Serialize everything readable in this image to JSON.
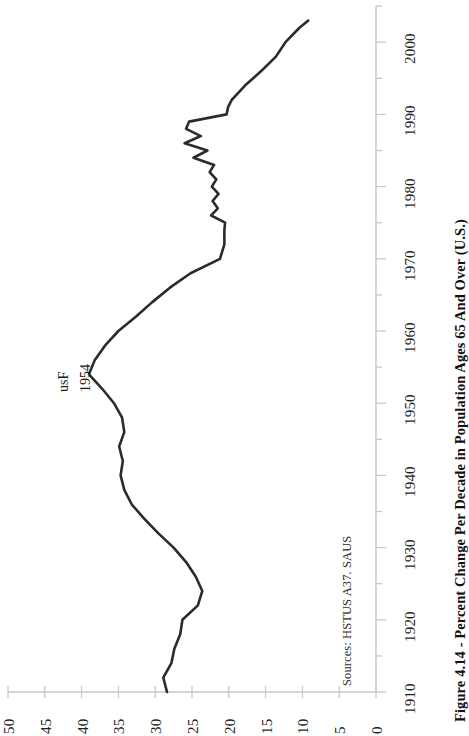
{
  "figure": {
    "title": "Figure 4.14 - Percent Change Per Decade in Population Ages 65 And Over (U.S.)",
    "source_note": "Sources: HSTUS A37. SAUS",
    "annotation_line1": "usF",
    "annotation_line2": "1954",
    "line_color": "#2b2b2b",
    "axis_color": "#c8c8c8",
    "text_color": "#1a1a1a",
    "background": "#ffffff",
    "orientation": "rotated-90-ccw"
  },
  "chart_data": {
    "type": "line",
    "title": "Figure 4.14 - Percent Change Per Decade in Population Ages 65 And Over (U.S.)",
    "subtitle": "",
    "xlabel": "",
    "ylabel": "",
    "grid": false,
    "legend": "none",
    "note": "Chart is drawn rotated 90 degrees: the year axis runs vertically (1910 bottom to 2000+ top) and the percent-change value axis runs horizontally along the bottom, increasing right-to-left from 0 to 50.",
    "year_axis": {
      "name": "Year",
      "ticks": [
        1910,
        1920,
        1930,
        1940,
        1950,
        1960,
        1970,
        1980,
        1990,
        2000
      ],
      "range": [
        1910,
        2005
      ],
      "minor_tick_step": 5,
      "position": "right-vertical",
      "direction": "bottom-to-top"
    },
    "value_axis": {
      "name": "Percent Change Per Decade",
      "ticks": [
        50,
        45,
        40,
        35,
        30,
        25,
        20,
        15,
        10,
        5,
        0
      ],
      "range": [
        0,
        50
      ],
      "position": "bottom-horizontal",
      "direction": "right-to-left"
    },
    "annotations": [
      {
        "text_line1": "usF",
        "text_line2": "1954",
        "year": 1954,
        "value": 39.0
      }
    ],
    "x": [
      1910,
      1912,
      1914,
      1916,
      1918,
      1920,
      1922,
      1924,
      1926,
      1928,
      1930,
      1932,
      1934,
      1936,
      1938,
      1940,
      1942,
      1944,
      1946,
      1948,
      1950,
      1952,
      1954,
      1956,
      1958,
      1960,
      1962,
      1964,
      1966,
      1968,
      1970,
      1972,
      1974,
      1975,
      1976,
      1977,
      1978,
      1979,
      1980,
      1981,
      1982,
      1983,
      1984,
      1985,
      1986,
      1987,
      1988,
      1989,
      1990,
      1991,
      1992,
      1994,
      1996,
      1998,
      2000,
      2002,
      2003
    ],
    "y": [
      28.4,
      28.9,
      27.8,
      27.4,
      26.6,
      26.3,
      24.2,
      23.6,
      24.5,
      25.8,
      27.5,
      29.6,
      31.5,
      33.2,
      34.2,
      34.7,
      34.4,
      34.9,
      34.2,
      34.5,
      35.6,
      37.2,
      39.0,
      38.2,
      36.8,
      35.0,
      32.6,
      30.4,
      28.0,
      25.2,
      21.2,
      20.6,
      20.6,
      20.5,
      22.4,
      21.5,
      22.2,
      21.4,
      22.3,
      21.7,
      22.6,
      22.0,
      24.8,
      22.9,
      26.0,
      23.8,
      25.8,
      25.4,
      20.3,
      20.1,
      19.6,
      17.8,
      15.6,
      13.6,
      12.3,
      10.4,
      9.2
    ],
    "series": [
      {
        "name": "Percent change per decade, population 65 and over",
        "values": [
          28.4,
          28.9,
          27.8,
          27.4,
          26.6,
          26.3,
          24.2,
          23.6,
          24.5,
          25.8,
          27.5,
          29.6,
          31.5,
          33.2,
          34.2,
          34.7,
          34.4,
          34.9,
          34.2,
          34.5,
          35.6,
          37.2,
          39.0,
          38.2,
          36.8,
          35.0,
          32.6,
          30.4,
          28.0,
          25.2,
          21.2,
          20.6,
          20.6,
          20.5,
          22.4,
          21.5,
          22.2,
          21.4,
          22.3,
          21.7,
          22.6,
          22.0,
          24.8,
          22.9,
          26.0,
          23.8,
          25.8,
          25.4,
          20.3,
          20.1,
          19.6,
          17.8,
          15.6,
          13.6,
          12.3,
          10.4,
          9.2
        ]
      }
    ]
  }
}
